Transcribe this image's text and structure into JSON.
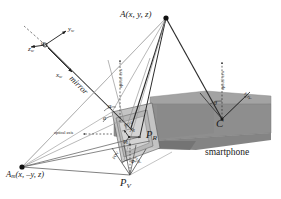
{
  "figure": {
    "background": "#ffffff",
    "colors": {
      "ink": "#1a1a1a",
      "phone_body": "#8c8c8c",
      "phone_top": "#a6a6a6",
      "phone_shadow": "#737373",
      "mirror_face": "#cfcfcf",
      "ray_light": "#b0b0b0",
      "ray_dark": "#3a3a3a"
    }
  },
  "labels": {
    "point_a": "A(x, y, z)",
    "point_a_mirror_base": "A",
    "point_a_mirror_sub": "m",
    "point_a_mirror_args": "(x, –y, z)",
    "camera_center": "C",
    "principal_real_base": "P",
    "principal_real_sub": "R",
    "principal_virtual_base": "P",
    "principal_virtual_sub": "V",
    "mirror": "mirror",
    "smartphone": "smartphone",
    "optical_axis_left": "optical axis",
    "optical_axis_mid": "optical axis",
    "optical_axis_right": "optical axis",
    "fov_right": "FOV",
    "fov_mid": "FOV",
    "fov_bottom_left": "FOV",
    "fov_bottom_right": "FOV",
    "alpha_upper": "α",
    "alpha_lower": "α",
    "alpha_axes": "α",
    "theta_right": "θ",
    "phi_bottom": "φ",
    "axis_xw_base": "x",
    "axis_xw_sub": "w",
    "axis_yw_base": "y",
    "axis_yw_sub": "w",
    "axis_zw_base": "z",
    "axis_zw_sub": "w",
    "axis_xr_base": "x",
    "axis_xr_sub": "R",
    "axis_yr_base": "y",
    "axis_yr_sub": "R"
  },
  "geometry": {
    "point_a": [
      166,
      17
    ],
    "point_a_mirror": [
      22,
      167
    ],
    "camera_center": [
      222,
      119
    ],
    "principal_real": [
      139,
      137
    ],
    "principal_virtual": [
      130,
      175
    ],
    "mirror_hinge": [
      118,
      150
    ]
  }
}
